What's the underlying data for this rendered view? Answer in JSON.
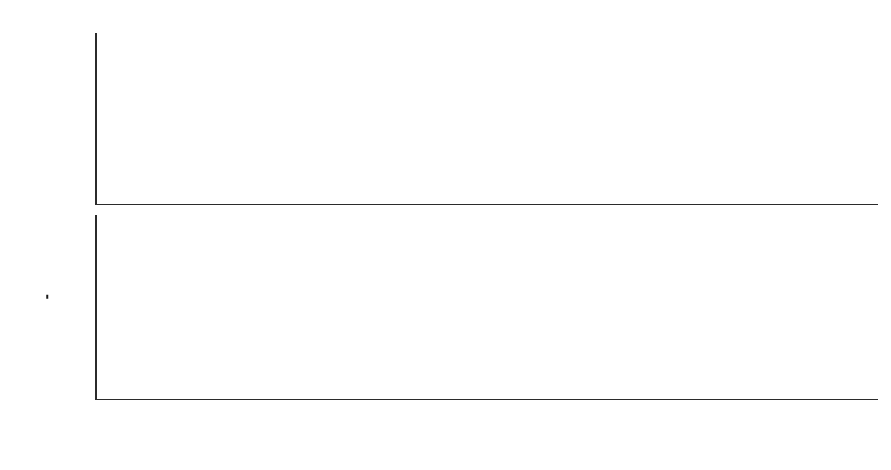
{
  "figure": {
    "background_color": "#ffffff",
    "axis_color": "#2b2b2b",
    "marker_color": "#141414",
    "marker_symbol": "asterisk-star"
  },
  "chart_data": [
    {
      "type": "scatter",
      "panel": "top",
      "title": "",
      "xlabel": "",
      "ylabel": "ε",
      "ylabel_plain": "epsilon",
      "yscale": "log",
      "xscale": "linear",
      "grid": false,
      "legend": null,
      "xlim": [
        1,
        9
      ],
      "ylim": [
        1e-16,
        30
      ],
      "xticks": [
        1,
        2,
        3,
        4,
        5,
        6,
        7,
        8,
        9
      ],
      "xticklabels": [
        "",
        "",
        "",
        "",
        "",
        "",
        "",
        "",
        ""
      ],
      "yticks": [
        10,
        0.01,
        1e-05,
        1e-08,
        1e-11,
        1e-14
      ],
      "yticklabels": [
        "10^1",
        "10^-2",
        "10^-5",
        "10^-8",
        "10^-11",
        "10^-14"
      ],
      "ytick_mantissa": [
        "10",
        "10",
        "10",
        "10",
        "10",
        "10"
      ],
      "ytick_exponents": [
        "1",
        "−2",
        "−5",
        "−8",
        "−11",
        "−14"
      ],
      "x": [
        1,
        2,
        3,
        4,
        5,
        6,
        7,
        8,
        9
      ],
      "values": [
        3.0,
        0.0013,
        2.2e-05,
        9.5e-07,
        6e-08,
        1.6e-09,
        1.4e-10,
        1.8e-12,
        2e-15
      ],
      "marker": "asterisk-star"
    },
    {
      "type": "scatter",
      "panel": "bottom",
      "title": "",
      "xlabel": "Number of iterations",
      "ylabel": "arccos (n^T p_3) 180°/π",
      "ylabel_parts": {
        "func": "arccos",
        "open_paren": "(",
        "vec_n": "n",
        "transpose": "T",
        "vec_p": "p",
        "p_subscript": "3",
        "close_paren": ")",
        "frac_numerator": "180°",
        "frac_denominator": "π"
      },
      "yscale": "linear",
      "xscale": "linear",
      "grid": false,
      "legend": null,
      "xlim": [
        1,
        9
      ],
      "ylim": [
        0,
        3.62
      ],
      "xticks": [
        1,
        2,
        3,
        4,
        5,
        6,
        7,
        8,
        9
      ],
      "xticklabels": [
        "1",
        "2",
        "3",
        "4",
        "5",
        "6",
        "7",
        "8",
        "9"
      ],
      "yticks": [
        1,
        2,
        3
      ],
      "yticklabels": [
        "1",
        "2",
        "3"
      ],
      "x": [
        1,
        2,
        3,
        4,
        5,
        6,
        7,
        8,
        9
      ],
      "values": [
        3.42,
        0.16,
        0.01,
        0.0,
        0.0,
        0.0,
        0.0,
        0.0,
        0.0
      ],
      "marker": "asterisk-star"
    }
  ]
}
